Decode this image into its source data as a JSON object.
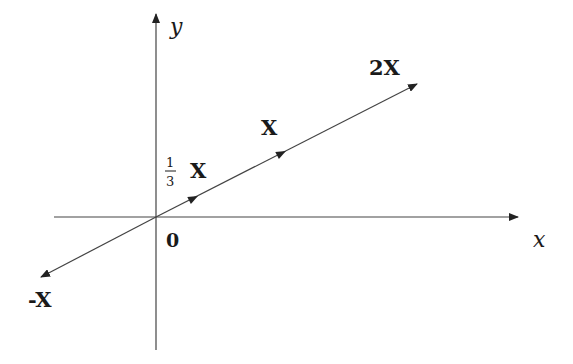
{
  "diagram": {
    "type": "vector-scaling",
    "axes": {
      "x_label": "x",
      "y_label": "y",
      "origin_label": "0"
    },
    "vectors": [
      {
        "label": "-X",
        "scale": -1
      },
      {
        "label": "X",
        "scale": 1,
        "fraction_label": {
          "numerator": "1",
          "denominator": "3"
        },
        "fraction_label_suffix": "X"
      },
      {
        "label": "X",
        "scale": 1
      },
      {
        "label": "2X",
        "scale": 2
      }
    ],
    "labels": {
      "neg_x": "-X",
      "third_num": "1",
      "third_den": "3",
      "third_x": "X",
      "one_x": "X",
      "two_x": "2X"
    },
    "colors": {
      "line": "#444444",
      "text": "#1a1a1a"
    }
  }
}
